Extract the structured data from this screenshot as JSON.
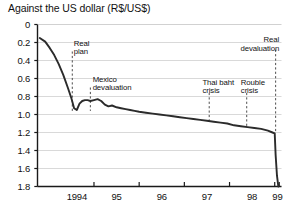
{
  "chart_data": {
    "type": "line",
    "title": "Against the US dollar (R$/US$)",
    "xlabel": "",
    "ylabel": "",
    "y_inverted": true,
    "ylim": [
      0,
      1.8
    ],
    "xlim": [
      1993.75,
      1999.15
    ],
    "grid": true,
    "legend": "none",
    "ytick_labels": [
      "0",
      "0.2",
      "0.4",
      "0.6",
      "0.8",
      "1.0",
      "1.2",
      "1.4",
      "1.6",
      "1.8"
    ],
    "ytick_values": [
      0,
      0.2,
      0.4,
      0.6,
      0.8,
      1.0,
      1.2,
      1.4,
      1.6,
      1.8
    ],
    "xtick_labels": [
      "1994",
      "95",
      "96",
      "97",
      "98",
      "99"
    ],
    "xtick_values": [
      1994,
      1995,
      1996,
      1997,
      1998,
      1999
    ],
    "series": [
      {
        "name": "R$/US$ exchange rate",
        "color": "#2b2b2b",
        "x": [
          1993.8,
          1993.92,
          1994.02,
          1994.12,
          1994.22,
          1994.32,
          1994.42,
          1994.5,
          1994.56,
          1994.62,
          1994.68,
          1994.74,
          1994.8,
          1994.86,
          1994.92,
          1995.0,
          1995.08,
          1995.16,
          1995.24,
          1995.32,
          1995.4,
          1995.5,
          1995.6,
          1995.7,
          1995.8,
          1995.9,
          1996.0,
          1996.15,
          1996.3,
          1996.45,
          1996.6,
          1996.75,
          1996.9,
          1997.05,
          1997.2,
          1997.35,
          1997.5,
          1997.65,
          1997.8,
          1997.95,
          1998.1,
          1998.25,
          1998.4,
          1998.55,
          1998.7,
          1998.85,
          1998.95,
          1999.0,
          1999.02,
          1999.05,
          1999.08
        ],
        "y": [
          0.15,
          0.19,
          0.26,
          0.34,
          0.44,
          0.56,
          0.7,
          0.82,
          0.93,
          0.95,
          0.88,
          0.85,
          0.84,
          0.84,
          0.85,
          0.84,
          0.83,
          0.85,
          0.89,
          0.91,
          0.9,
          0.92,
          0.93,
          0.94,
          0.95,
          0.96,
          0.97,
          0.98,
          0.99,
          1.0,
          1.01,
          1.02,
          1.03,
          1.04,
          1.05,
          1.06,
          1.07,
          1.08,
          1.09,
          1.1,
          1.12,
          1.13,
          1.14,
          1.15,
          1.16,
          1.18,
          1.2,
          1.21,
          1.45,
          1.68,
          1.8
        ]
      }
    ],
    "annotations": [
      {
        "id": "real-plan",
        "label": "Real\nplan",
        "x": 1994.52,
        "text_x": 1994.55,
        "text_y": 0.17,
        "align": "left",
        "line_top": 0.3,
        "line_bottom": 0.96
      },
      {
        "id": "mexico-devaluation",
        "label": "Mexico\ndevaluation",
        "x": 1994.92,
        "text_x": 1994.97,
        "text_y": 0.57,
        "align": "left",
        "line_top": 0.7,
        "line_bottom": 0.96
      },
      {
        "id": "thai-baht-crisis",
        "label": "Thai baht\ncrisis",
        "x": 1997.55,
        "text_x": 1997.4,
        "text_y": 0.6,
        "align": "left",
        "line_top": 0.76,
        "line_bottom": 1.07
      },
      {
        "id": "rouble-crisis",
        "label": "Rouble\ncrisis",
        "x": 1998.38,
        "text_x": 1998.25,
        "text_y": 0.6,
        "align": "left",
        "line_top": 0.76,
        "line_bottom": 1.14
      },
      {
        "id": "real-devaluation",
        "label": "Real\ndevaluation",
        "x": 1999.02,
        "text_x": 1999.1,
        "text_y": 0.13,
        "align": "right",
        "line_top": 0.28,
        "line_bottom": 1.2
      }
    ]
  }
}
